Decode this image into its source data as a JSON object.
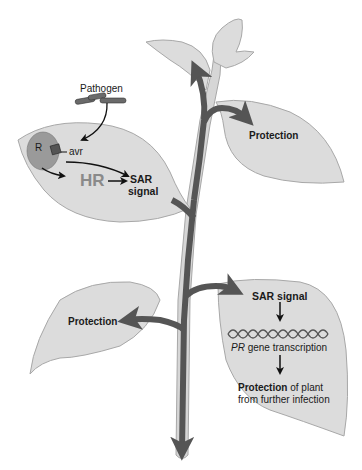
{
  "colors": {
    "leaf_fill": "#dcdcdc",
    "leaf_stroke": "#a8a8a8",
    "stem_fill": "#d6d6d6",
    "signal_arrow": "#555555",
    "text": "#1a1a1a",
    "hr_text": "#8a8a8a",
    "r_protein": "#9a9a9a"
  },
  "infected_leaf": {
    "pathogen_label": "Pathogen",
    "r_label": "R",
    "avr_label": "avr",
    "hr_label": "HR",
    "sar_signal_line1": "SAR",
    "sar_signal_line2": "signal"
  },
  "upper_right_leaf": {
    "label": "Protection"
  },
  "lower_left_leaf": {
    "label": "Protection"
  },
  "lower_right_leaf": {
    "sar_signal": "SAR signal",
    "pr_italic": "PR",
    "pr_rest": " gene transcription",
    "protection_bold": "Protection",
    "protection_rest": " of plant",
    "protection_line2": "from further infection"
  }
}
